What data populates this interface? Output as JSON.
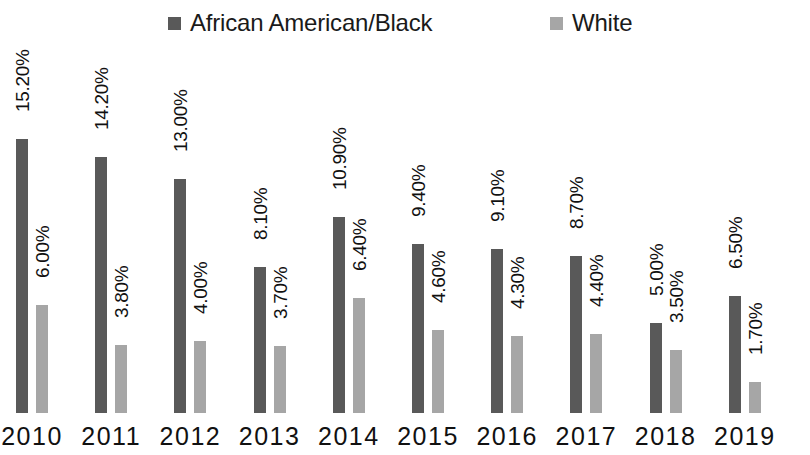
{
  "chart_data": {
    "type": "bar",
    "title": "",
    "subtitle": "",
    "xlabel": "",
    "ylabel": "",
    "grid": false,
    "legend_position": "top",
    "ylim": [
      0,
      15.2
    ],
    "axis_visible": false,
    "categories": [
      "2010",
      "2011",
      "2012",
      "2013",
      "2014",
      "2015",
      "2016",
      "2017",
      "2018",
      "2019"
    ],
    "series": [
      {
        "name": "African American/Black",
        "color": "#595959",
        "values": [
          15.2,
          14.2,
          13.0,
          8.1,
          10.9,
          9.4,
          9.1,
          8.7,
          5.0,
          6.5
        ],
        "labels": [
          "15.20%",
          "14.20%",
          "13.00%",
          "8.10%",
          "10.90%",
          "9.40%",
          "9.10%",
          "8.70%",
          "5.00%",
          "6.50%"
        ]
      },
      {
        "name": "White",
        "color": "#a6a6a6",
        "values": [
          6.0,
          3.8,
          4.0,
          3.7,
          6.4,
          4.6,
          4.3,
          4.4,
          3.5,
          1.7
        ],
        "labels": [
          "6.00%",
          "3.80%",
          "4.00%",
          "3.70%",
          "6.40%",
          "4.60%",
          "4.30%",
          "4.40%",
          "3.50%",
          "1.70%"
        ]
      }
    ]
  },
  "legend": {
    "items": [
      {
        "label": "African American/Black",
        "swatch": "legend-swatch-dark"
      },
      {
        "label": "White",
        "swatch": "legend-swatch-light"
      }
    ]
  }
}
